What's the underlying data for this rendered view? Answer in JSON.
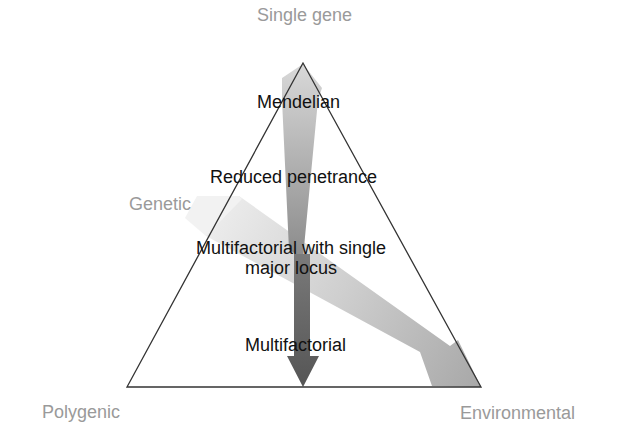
{
  "diagram": {
    "corners": {
      "top": "Single gene",
      "left_side": "Genetic",
      "bottom_left": "Polygenic",
      "bottom_right": "Environmental"
    },
    "inner_labels": {
      "mendelian": "Mendelian",
      "reduced_penetrance": "Reduced penetrance",
      "multifactorial_major_locus_line1": "Multifactorial with single",
      "multifactorial_major_locus_line2": "major locus",
      "multifactorial": "Multifactorial"
    },
    "arrows": [
      {
        "name": "genetic-to-polygenic",
        "description": "vertical arrow from single gene apex down to base",
        "color_top": "#c8c8c8",
        "color_bottom": "#5e5e5e"
      },
      {
        "name": "genetic-to-environmental",
        "description": "diagonal band from genetic side to environmental corner",
        "color_start": "#ececec",
        "color_end": "#a9a9a9"
      }
    ],
    "colors": {
      "corner_label": "#9a9a9a",
      "inner_label": "#111111",
      "triangle_stroke": "#333333",
      "background": "#ffffff"
    }
  }
}
